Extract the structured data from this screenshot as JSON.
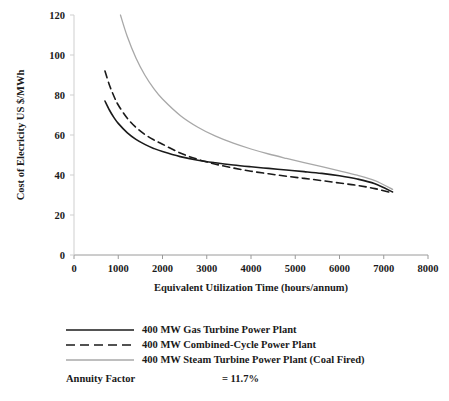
{
  "chart_data": {
    "type": "line",
    "title": "",
    "xlabel": "Equivalent Utilization Time (hours/annum)",
    "ylabel": "Cost of Elecricity US $/MWh",
    "xlim": [
      0,
      8000
    ],
    "ylim": [
      0,
      120
    ],
    "xticks": [
      "0",
      "1000",
      "2000",
      "3000",
      "4000",
      "5000",
      "6000",
      "7000",
      "8000"
    ],
    "yticks": [
      "0",
      "20",
      "40",
      "60",
      "80",
      "100",
      "120"
    ],
    "grid": false,
    "legend_position": "below-plot",
    "series": [
      {
        "name": "400 MW Gas Turbine Power Plant",
        "style": "solid",
        "color": "#1a1a1a",
        "x": [
          700,
          800,
          900,
          1000,
          1200,
          1400,
          1600,
          1800,
          2000,
          2400,
          2800,
          3200,
          3600,
          4000,
          4400,
          4800,
          5200,
          5600,
          6000,
          6400,
          6800,
          7200
        ],
        "y": [
          77.0,
          72.5,
          68.8,
          65.8,
          61.2,
          57.8,
          55.3,
          53.3,
          51.7,
          49.2,
          47.4,
          46.1,
          45.0,
          44.1,
          43.3,
          42.5,
          41.7,
          40.8,
          39.6,
          38.0,
          35.6,
          31.5
        ]
      },
      {
        "name": "400 MW Combined-Cycle Power Plant",
        "style": "dashed",
        "color": "#1a1a1a",
        "x": [
          700,
          800,
          900,
          1000,
          1200,
          1400,
          1600,
          1800,
          2000,
          2400,
          2800,
          3200,
          3600,
          4000,
          4400,
          4800,
          5200,
          5600,
          6000,
          6400,
          6800,
          7200
        ],
        "y": [
          92.0,
          85.0,
          79.5,
          75.0,
          68.5,
          63.8,
          60.3,
          57.6,
          55.4,
          51.0,
          47.8,
          45.4,
          43.5,
          41.9,
          40.6,
          39.4,
          38.3,
          37.2,
          36.0,
          34.8,
          33.2,
          31.0
        ]
      },
      {
        "name": "400 MW Steam Turbine Power Plant (Coal Fired)",
        "style": "solid",
        "color": "#a8a8a8",
        "x": [
          1050,
          1200,
          1400,
          1600,
          1800,
          2000,
          2400,
          2800,
          3200,
          3600,
          4000,
          4400,
          4800,
          5200,
          5600,
          6000,
          6400,
          6800,
          7200
        ],
        "y": [
          120.0,
          109.5,
          98.5,
          90.0,
          83.3,
          78.0,
          69.8,
          63.9,
          59.4,
          55.9,
          53.0,
          50.5,
          48.3,
          46.2,
          44.2,
          42.1,
          39.9,
          37.2,
          32.8
        ]
      }
    ]
  },
  "legend": {
    "items": [
      {
        "label": "400 MW Gas Turbine Power Plant",
        "style": "solid",
        "color": "#1a1a1a"
      },
      {
        "label": "400 MW Combined-Cycle Power Plant",
        "style": "dashed",
        "color": "#1a1a1a"
      },
      {
        "label": "400 MW Steam Turbine Power Plant (Coal Fired)",
        "style": "solid",
        "color": "#a8a8a8"
      }
    ],
    "annuity_label": "Annuity Factor",
    "annuity_value": "= 11.7%"
  }
}
